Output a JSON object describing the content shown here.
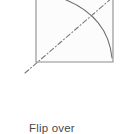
{
  "figure": {
    "kind": "origami-fold-step-diagram",
    "background_color": "#ffffff",
    "caption": "Flip over",
    "caption_color": "#4a4a4a",
    "shape": {
      "name": "square-sheet",
      "stroke_color": "#8d8d8d",
      "fill_color": "#fcfcfc",
      "left": 36,
      "right": 113,
      "top": -16,
      "bottom": 62
    },
    "arc": {
      "name": "rotation-arc",
      "stroke_color": "#6e6e6e",
      "start_x": 36,
      "start_y": -9,
      "control_x": 107,
      "control_y": 5,
      "end_x": 112,
      "end_y": 58
    },
    "axis_line": {
      "name": "flip-axis-dash-dot-line",
      "stroke_color": "#7a7a7a",
      "style": "dash-dot",
      "x1": 25,
      "y1": 73,
      "x2": 120,
      "y2": -9
    }
  }
}
